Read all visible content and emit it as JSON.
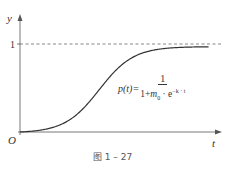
{
  "chart_data": {
    "type": "line",
    "title": "",
    "xlabel": "t",
    "ylabel": "y",
    "origin_label": "O",
    "yticks": [
      {
        "value": 1,
        "label": "1"
      }
    ],
    "asymptote": {
      "y": 1,
      "style": "dashed"
    },
    "series": [
      {
        "name": "logistic curve",
        "function": "p(t) = 1 / (1 + m0 · e^(-k·t))",
        "x_range": [
          0,
          10
        ],
        "midpoint": 4.2,
        "k": 1.1
      }
    ],
    "xlim": [
      0,
      10.5
    ],
    "ylim": [
      0,
      1.25
    ],
    "grid": false,
    "legend": "none"
  },
  "formula": {
    "lhs": "p(t)=",
    "numerator": "1",
    "denominator_prefix": "1+",
    "m": "m",
    "m_sub": "0",
    "dot": " · e",
    "exponent": "−k · t"
  },
  "caption": "图 1 – 27"
}
